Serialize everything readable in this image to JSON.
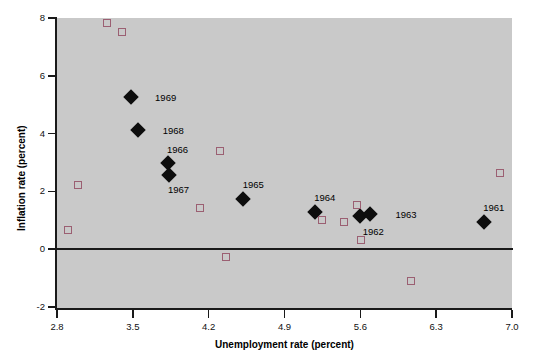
{
  "chart_data": {
    "type": "scatter",
    "title": "",
    "xlabel": "Unemployment rate (percent)",
    "ylabel": "Inflation rate (percent)",
    "xlim": [
      2.8,
      7.0
    ],
    "ylim": [
      -2,
      8
    ],
    "xticks": [
      "2.8",
      "3.5",
      "4.2",
      "4.9",
      "5.6",
      "6.3",
      "7.0"
    ],
    "xtick_values": [
      2.8,
      3.5,
      4.2,
      4.9,
      5.6,
      6.3,
      7.0
    ],
    "yticks": [
      "8",
      "6",
      "4",
      "2",
      "0",
      "-2"
    ],
    "ytick_values": [
      8,
      6,
      4,
      2,
      0,
      -2
    ],
    "grid": false,
    "legend": null,
    "plot_background": "#c9c9c9",
    "zero_line": 0,
    "series": [
      {
        "name": "labeled-years",
        "marker": "filled-diamond",
        "color": "#0d0d0d",
        "points": [
          {
            "label": "1969",
            "x": 3.48,
            "y": 5.27,
            "label_dx": 26,
            "label_dy": 0
          },
          {
            "label": "1968",
            "x": 3.55,
            "y": 4.14,
            "label_dx": 26,
            "label_dy": 0
          },
          {
            "label": "1966",
            "x": 3.82,
            "y": 2.98,
            "label_dx": 1,
            "label_dy": -14
          },
          {
            "label": "1967",
            "x": 3.83,
            "y": 2.57,
            "label_dx": 1,
            "label_dy": 14
          },
          {
            "label": "1965",
            "x": 4.52,
            "y": 1.72,
            "label_dx": 1,
            "label_dy": -15
          },
          {
            "label": "1964",
            "x": 5.18,
            "y": 1.3,
            "label_dx": 1,
            "label_dy": -15
          },
          {
            "label": "1962",
            "x": 5.6,
            "y": 1.16,
            "label_dx": 4,
            "label_dy": 15
          },
          {
            "label": "1963",
            "x": 5.69,
            "y": 1.23,
            "label_dx": 27,
            "label_dy": 0
          },
          {
            "label": "1961",
            "x": 6.74,
            "y": 0.95,
            "label_dx": 1,
            "label_dy": -15
          }
        ]
      },
      {
        "name": "other-years",
        "marker": "open-square",
        "color": "#9b5f72",
        "points": [
          {
            "x": 3.26,
            "y": 7.82
          },
          {
            "x": 3.4,
            "y": 7.51
          },
          {
            "x": 2.99,
            "y": 2.22
          },
          {
            "x": 2.9,
            "y": 0.66
          },
          {
            "x": 4.3,
            "y": 3.41
          },
          {
            "x": 4.12,
            "y": 1.43
          },
          {
            "x": 4.36,
            "y": -0.27
          },
          {
            "x": 5.25,
            "y": 1.02
          },
          {
            "x": 5.57,
            "y": 1.54
          },
          {
            "x": 5.45,
            "y": 0.94
          },
          {
            "x": 5.61,
            "y": 0.31
          },
          {
            "x": 6.07,
            "y": -1.11
          },
          {
            "x": 6.89,
            "y": 2.64
          }
        ]
      }
    ]
  },
  "figure": {
    "plot_left": 57,
    "plot_top": 18,
    "plot_right": 512,
    "plot_bottom": 307
  }
}
